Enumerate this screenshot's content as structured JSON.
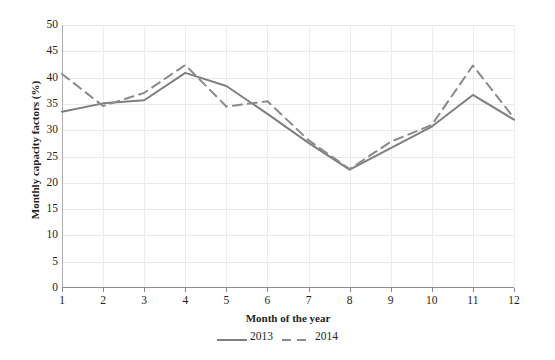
{
  "chart_data": {
    "type": "line",
    "title": "",
    "xlabel": "Month of the year",
    "ylabel": "Monthly capacity factors (%)",
    "x": [
      1,
      2,
      3,
      4,
      5,
      6,
      7,
      8,
      9,
      10,
      11,
      12
    ],
    "categories": [
      "1",
      "2",
      "3",
      "4",
      "5",
      "6",
      "7",
      "8",
      "9",
      "10",
      "11",
      "12"
    ],
    "xlim": [
      1,
      12
    ],
    "ylim": [
      0,
      50
    ],
    "yticks": [
      0,
      5,
      10,
      15,
      20,
      25,
      30,
      35,
      40,
      45,
      50
    ],
    "ytick_labels": [
      "0",
      "5",
      "10",
      "15",
      "20",
      "25",
      "30",
      "35",
      "40",
      "45",
      "50"
    ],
    "grid": true,
    "grid_axis": "both",
    "legend_position": "bottom-center",
    "series": [
      {
        "name": "2013",
        "style": "solid",
        "color": "#7f7f7f",
        "values": [
          33.5,
          35.1,
          35.7,
          40.9,
          38.4,
          33.1,
          27.6,
          22.5,
          26.6,
          30.7,
          36.7,
          32.0
        ]
      },
      {
        "name": "2014",
        "style": "dashed",
        "color": "#8a8a8a",
        "values": [
          40.7,
          34.6,
          37.1,
          42.4,
          34.5,
          35.5,
          28.1,
          22.6,
          27.8,
          31.0,
          42.3,
          32.3
        ]
      }
    ]
  },
  "legend": {
    "entries": [
      {
        "label": "2013",
        "style": "solid"
      },
      {
        "label": "2014",
        "style": "dashed"
      }
    ]
  },
  "colors": {
    "series_2013": "#7f7f7f",
    "series_2014": "#8a8a8a",
    "grid": "#e9e9ea",
    "axis": "#8c8c8c",
    "text": "#231f20",
    "background": "#ffffff"
  }
}
